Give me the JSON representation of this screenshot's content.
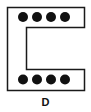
{
  "diagram": {
    "label": "D",
    "shape": "c-channel-outline",
    "stroke_color": "#1a1a1a",
    "dot_color": "#111111",
    "top_row_dots": 4,
    "bottom_row_dots": 4
  }
}
